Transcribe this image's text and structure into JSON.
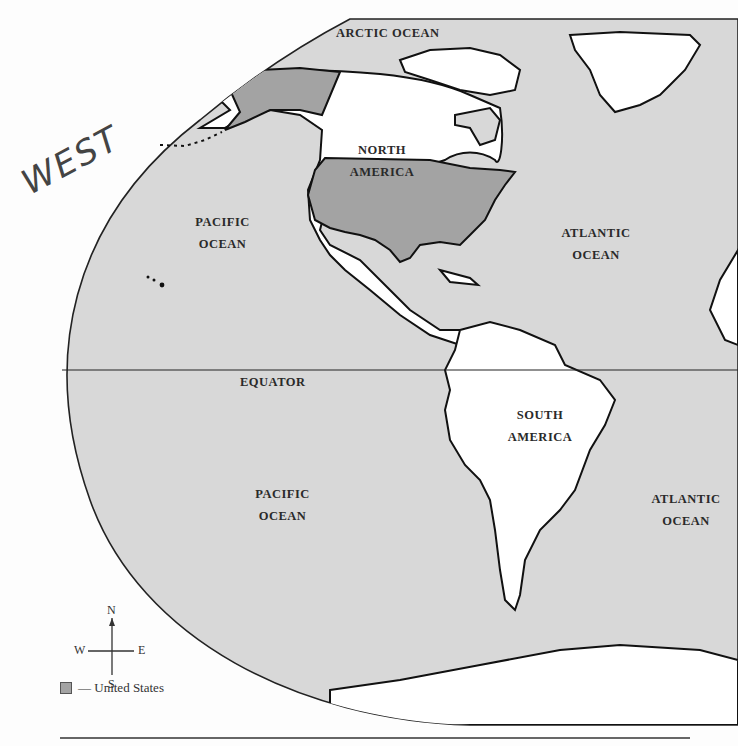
{
  "map": {
    "title": "",
    "colors": {
      "ocean": "#d8d8d8",
      "land": "#ffffff",
      "united_states": "#a3a3a3",
      "outline": "#111111"
    },
    "labels": {
      "arctic_ocean": "ARCTIC OCEAN",
      "north_america_1": "NORTH",
      "north_america_2": "AMERICA",
      "pacific_north_1": "PACIFIC",
      "pacific_north_2": "OCEAN",
      "atlantic_north_1": "ATLANTIC",
      "atlantic_north_2": "OCEAN",
      "equator": "EQUATOR",
      "south_america_1": "SOUTH",
      "south_america_2": "AMERICA",
      "pacific_south_1": "PACIFIC",
      "pacific_south_2": "OCEAN",
      "atlantic_south_1": "ATLANTIC",
      "atlantic_south_2": "OCEAN"
    },
    "handwritten_annotation": "WEST",
    "compass": {
      "n": "N",
      "s": "S",
      "e": "E",
      "w": "W"
    },
    "legend": {
      "label": "— United States"
    }
  }
}
